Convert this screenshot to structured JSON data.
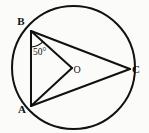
{
  "figure": {
    "background_color": "#fbfbfa",
    "stroke_color": "#111111"
  },
  "circle": {
    "label": "circle",
    "cx": 73.5,
    "cy": 67.5,
    "r": 61.5,
    "stroke_width": 2.0
  },
  "points": {
    "A": {
      "label": "A",
      "x": 31,
      "y": 106,
      "label_x": 22,
      "label_y": 113
    },
    "B": {
      "label": "B",
      "x": 31,
      "y": 31,
      "label_x": 21,
      "label_y": 25
    },
    "C": {
      "label": "C",
      "x": 130,
      "y": 69,
      "label_x": 136,
      "label_y": 73
    },
    "O": {
      "label": "O",
      "x": 72,
      "y": 68,
      "label_x": 77,
      "label_y": 73
    }
  },
  "segments": [
    {
      "name": "segment-AB",
      "from": "B",
      "to": "A"
    },
    {
      "name": "segment-BO",
      "from": "B",
      "to": "O"
    },
    {
      "name": "segment-AO",
      "from": "A",
      "to": "O"
    },
    {
      "name": "segment-BC",
      "from": "B",
      "to": "C"
    },
    {
      "name": "segment-AC",
      "from": "A",
      "to": "C"
    }
  ],
  "angle": {
    "label": "50°",
    "value": 50,
    "unit": "degrees",
    "at_vertex": "B",
    "between": [
      "BA",
      "BO"
    ],
    "label_x": 33,
    "label_y": 55,
    "arc_radius": 16
  },
  "chart_data": {
    "type": "diagram",
    "elements": [
      {
        "kind": "circle",
        "center": "O",
        "cx": 73.5,
        "cy": 67.5,
        "r": 61.5
      },
      {
        "kind": "point",
        "name": "A",
        "x": 31,
        "y": 106
      },
      {
        "kind": "point",
        "name": "B",
        "x": 31,
        "y": 31
      },
      {
        "kind": "point",
        "name": "C",
        "x": 130,
        "y": 69
      },
      {
        "kind": "point",
        "name": "O",
        "x": 72,
        "y": 68
      },
      {
        "kind": "segment",
        "from": "A",
        "to": "B"
      },
      {
        "kind": "segment",
        "from": "B",
        "to": "O"
      },
      {
        "kind": "segment",
        "from": "A",
        "to": "O"
      },
      {
        "kind": "segment",
        "from": "B",
        "to": "C"
      },
      {
        "kind": "segment",
        "from": "A",
        "to": "C"
      },
      {
        "kind": "angle-marker",
        "vertex": "B",
        "rays": [
          "A",
          "O"
        ],
        "value": 50,
        "label": "50°"
      }
    ]
  }
}
